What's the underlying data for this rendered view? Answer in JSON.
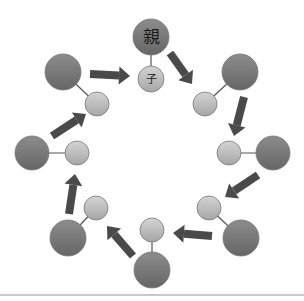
{
  "diagram": {
    "title_parent_label": "親",
    "title_child_label": "子",
    "colors": {
      "parent_fill_top": "#8a8a8a",
      "parent_fill_bottom": "#6a6a6a",
      "child_fill_top": "#d2d2d2",
      "child_fill_bottom": "#a8a8a8",
      "arrow": "#4a4a4a",
      "link": "#555555",
      "stroke": "#777777"
    },
    "pairs": [
      {
        "id": "top",
        "parent": {
          "x": 151,
          "y": 37,
          "r": 18,
          "label": "親"
        },
        "child": {
          "x": 151,
          "y": 79,
          "r": 13,
          "label": "子"
        }
      },
      {
        "id": "upper-right",
        "parent": {
          "x": 240,
          "y": 72,
          "r": 18,
          "label": ""
        },
        "child": {
          "x": 205,
          "y": 104,
          "r": 12,
          "label": ""
        }
      },
      {
        "id": "right",
        "parent": {
          "x": 273,
          "y": 153,
          "r": 17,
          "label": ""
        },
        "child": {
          "x": 229,
          "y": 153,
          "r": 12,
          "label": ""
        }
      },
      {
        "id": "lower-right",
        "parent": {
          "x": 241,
          "y": 238,
          "r": 18,
          "label": ""
        },
        "child": {
          "x": 209,
          "y": 208,
          "r": 12,
          "label": ""
        }
      },
      {
        "id": "bottom",
        "parent": {
          "x": 152,
          "y": 270,
          "r": 18,
          "label": ""
        },
        "child": {
          "x": 152,
          "y": 230,
          "r": 12,
          "label": ""
        }
      },
      {
        "id": "lower-left",
        "parent": {
          "x": 68,
          "y": 238,
          "r": 18,
          "label": ""
        },
        "child": {
          "x": 96,
          "y": 208,
          "r": 12,
          "label": ""
        }
      },
      {
        "id": "left",
        "parent": {
          "x": 32,
          "y": 153,
          "r": 17,
          "label": ""
        },
        "child": {
          "x": 77,
          "y": 153,
          "r": 12,
          "label": ""
        }
      },
      {
        "id": "upper-left",
        "parent": {
          "x": 63,
          "y": 72,
          "r": 18,
          "label": ""
        },
        "child": {
          "x": 97,
          "y": 104,
          "r": 12,
          "label": ""
        }
      }
    ],
    "arrows": [
      {
        "from": "upper-left",
        "to": "top",
        "x1": 90,
        "y1": 74,
        "x2": 130,
        "y2": 76
      },
      {
        "from": "top",
        "to": "upper-right",
        "x1": 170,
        "y1": 53,
        "x2": 192,
        "y2": 84
      },
      {
        "from": "upper-right",
        "to": "right",
        "x1": 244,
        "y1": 97,
        "x2": 234,
        "y2": 136
      },
      {
        "from": "right",
        "to": "lower-right",
        "x1": 258,
        "y1": 175,
        "x2": 225,
        "y2": 197
      },
      {
        "from": "lower-right",
        "to": "bottom",
        "x1": 212,
        "y1": 236,
        "x2": 173,
        "y2": 233
      },
      {
        "from": "bottom",
        "to": "lower-left",
        "x1": 133,
        "y1": 256,
        "x2": 107,
        "y2": 226
      },
      {
        "from": "lower-left",
        "to": "left",
        "x1": 69,
        "y1": 214,
        "x2": 75,
        "y2": 174
      },
      {
        "from": "left",
        "to": "upper-left",
        "x1": 52,
        "y1": 136,
        "x2": 86,
        "y2": 114
      }
    ]
  }
}
